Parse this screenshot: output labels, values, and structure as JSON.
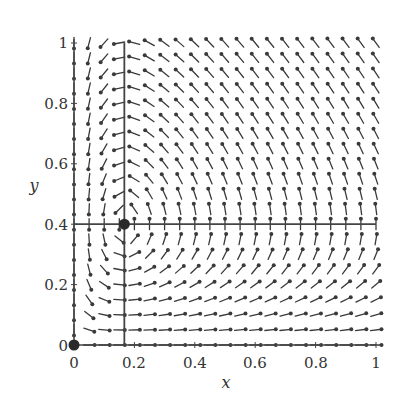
{
  "chart_data": {
    "type": "vector_field",
    "title": "",
    "xlabel": "x",
    "ylabel": "y",
    "xlim": [
      0,
      1
    ],
    "ylim": [
      0,
      1
    ],
    "x_ticks": [
      0,
      0.2,
      0.4,
      0.6,
      0.8,
      1
    ],
    "y_ticks": [
      0,
      0.2,
      0.4,
      0.6,
      0.8,
      1
    ],
    "x_tick_labels": [
      "0",
      "0.2",
      "0.4",
      "0.6",
      "0.8",
      "1"
    ],
    "y_tick_labels": [
      "0",
      "0.2",
      "0.4",
      "0.6",
      "0.8",
      "1"
    ],
    "grid": false,
    "grid_points": 21,
    "field": {
      "description": "Predator-prey direction field: dx/dt = x(0.4 - y), dy/dt = y(x - 1/6); arrows normalized to equal length with dot heads",
      "equilibria": [
        {
          "x": 0,
          "y": 0,
          "label": "origin"
        },
        {
          "x": 0.1667,
          "y": 0.4,
          "label": "interior"
        }
      ],
      "nullclines": [
        {
          "orientation": "vertical",
          "x": 0.1667,
          "y_range": [
            0,
            1
          ]
        },
        {
          "orientation": "horizontal",
          "y": 0.4,
          "x_range": [
            0,
            1
          ]
        }
      ],
      "params": {
        "a": 0.4,
        "b": 0.1667
      }
    },
    "colors": {
      "arrow": "#3a3a3a",
      "axis": "#444444",
      "equilibrium": "#2a2a2a",
      "text": "#333333"
    }
  }
}
